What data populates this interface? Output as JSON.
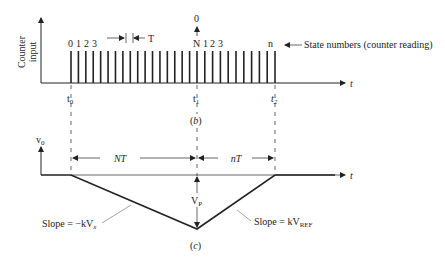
{
  "top_diagram": {
    "y_axis_label": [
      "Counter",
      "input"
    ],
    "x_axis_label": "t",
    "pulses_before_t1": 17,
    "pulses_after_t1": 10,
    "state_labels_start": [
      "0",
      "1",
      "2",
      "3"
    ],
    "state_labels_mid": [
      "N",
      "1",
      "2",
      "3"
    ],
    "state_label_end": "n",
    "reset_label": "0",
    "period_label": "T",
    "state_numbers_annotation": "State numbers (counter reading)",
    "time_labels": {
      "t0": "t",
      "t0_sub": "0",
      "t1": "t",
      "t1_sub": "1",
      "t2": "t",
      "t2_sub": "2"
    },
    "caption": "(b)"
  },
  "bottom_diagram": {
    "y_axis_label": "v",
    "y_axis_sub": "0",
    "x_axis_label": "t",
    "interval_1": "NT",
    "interval_2": "nT",
    "peak_label": "V",
    "peak_sub": "P",
    "slope_down_label": "Slope = −kV",
    "slope_down_sub": "x",
    "slope_up_label": "Slope = kV",
    "slope_up_sub": "REF",
    "caption": "(c)"
  }
}
